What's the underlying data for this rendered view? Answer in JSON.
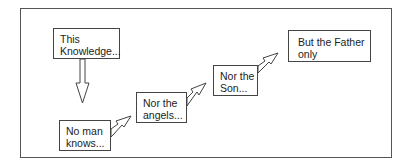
{
  "diagram": {
    "type": "flow-sequence",
    "nodes": [
      {
        "id": "knowledge",
        "label": "This\nKnowledge..."
      },
      {
        "id": "noman",
        "label": "No man\nknows..."
      },
      {
        "id": "angels",
        "label": "Nor the\nangels..."
      },
      {
        "id": "son",
        "label": "Nor the\nSon..."
      },
      {
        "id": "father",
        "label": "But the Father\nonly"
      }
    ],
    "edges": [
      {
        "from": "knowledge",
        "to": "noman",
        "style": "hollow-block-arrow",
        "direction": "down"
      },
      {
        "from": "noman",
        "to": "angels",
        "style": "hollow-block-arrow",
        "direction": "up-right"
      },
      {
        "from": "angels",
        "to": "son",
        "style": "hollow-block-arrow",
        "direction": "up-right"
      },
      {
        "from": "son",
        "to": "father",
        "style": "hollow-block-arrow",
        "direction": "up-right"
      }
    ],
    "colors": {
      "border": "#444444",
      "text": "#222222",
      "background": "#ffffff"
    }
  }
}
